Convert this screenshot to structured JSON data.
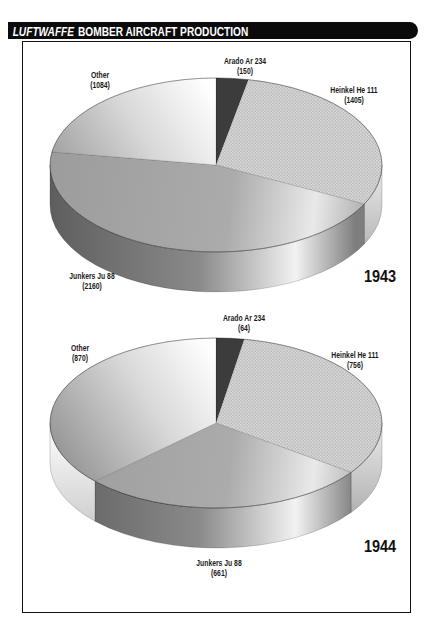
{
  "header": {
    "title_italic": "LUFTWAFFE",
    "title_rest": "BOMBER AIRCRAFT PRODUCTION"
  },
  "colors": {
    "header_bg": "#0b0b0b",
    "header_text": "#ffffff",
    "frame_border": "#111111",
    "slice_arado": "#3c3c3c",
    "slice_heinkel": "#cccccc",
    "slice_junkers": "#a0a0a0",
    "slice_other": "#ffffff"
  },
  "chart_data": [
    {
      "type": "pie",
      "style": "3d",
      "year": "1943",
      "title": "Luftwaffe bomber aircraft production 1943",
      "direction": "clockwise",
      "start_angle_deg": 0,
      "total": 4799,
      "slices": [
        {
          "label": "Arado Ar 234",
          "value": 150
        },
        {
          "label": "Heinkel He 111",
          "value": 1405
        },
        {
          "label": "Junkers Ju 88",
          "value": 2160
        },
        {
          "label": "Other",
          "value": 1084
        }
      ]
    },
    {
      "type": "pie",
      "style": "3d",
      "year": "1944",
      "title": "Luftwaffe bomber aircraft production 1944",
      "direction": "clockwise",
      "start_angle_deg": 0,
      "total": 2351,
      "slices": [
        {
          "label": "Arado Ar 234",
          "value": 64
        },
        {
          "label": "Heinkel He 111",
          "value": 756
        },
        {
          "label": "Junkers Ju 88",
          "value": 661
        },
        {
          "label": "Other",
          "value": 870
        }
      ]
    }
  ]
}
